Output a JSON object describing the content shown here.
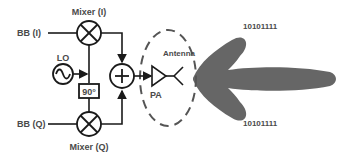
{
  "diagram": {
    "labels": {
      "mixer_i": "Mixer (I)",
      "mixer_q": "Mixer (Q)",
      "bb_i": "BB (I)",
      "bb_q": "BB (Q)",
      "lo": "LO",
      "phase_shift": "90°",
      "pa": "PA",
      "antenna": "Antenna",
      "bits_top": "10101111",
      "bits_bottom": "10101111"
    },
    "colors": {
      "line": "#1a1a1a",
      "text": "#4a4a4a",
      "beam": "#666666",
      "dashed": "#555555"
    }
  }
}
